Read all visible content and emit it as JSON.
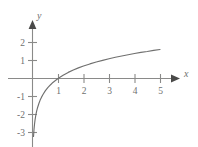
{
  "chart_data": {
    "type": "line",
    "title": "",
    "xlabel": "x",
    "ylabel": "y",
    "function": "y = ln(x)",
    "xlim": [
      0,
      5.6
    ],
    "ylim": [
      -3.6,
      2.4
    ],
    "grid": false,
    "legend": null,
    "x_ticks": [
      1,
      2,
      3,
      4,
      5
    ],
    "x_tick_labels": [
      "1",
      "2",
      "3",
      "4",
      "5"
    ],
    "y_ticks": [
      -3,
      -2,
      -1,
      1,
      2
    ],
    "y_tick_labels": [
      "-3",
      "-2",
      "-1",
      "1",
      "2"
    ],
    "x": [
      0.04,
      0.06,
      0.08,
      0.1,
      0.13,
      0.16,
      0.2,
      0.25,
      0.3,
      0.35,
      0.4,
      0.5,
      0.6,
      0.7,
      0.8,
      0.9,
      1.0,
      1.2,
      1.4,
      1.6,
      1.8,
      2.0,
      2.25,
      2.5,
      2.75,
      3.0,
      3.25,
      3.5,
      3.75,
      4.0,
      4.25,
      4.5,
      4.75,
      5.0
    ],
    "y": [
      -3.22,
      -2.81,
      -2.53,
      -2.3,
      -2.04,
      -1.83,
      -1.61,
      -1.39,
      -1.2,
      -1.05,
      -0.92,
      -0.69,
      -0.51,
      -0.36,
      -0.22,
      -0.11,
      0.0,
      0.18,
      0.34,
      0.47,
      0.59,
      0.69,
      0.81,
      0.92,
      1.01,
      1.1,
      1.18,
      1.25,
      1.32,
      1.39,
      1.45,
      1.5,
      1.56,
      1.61
    ],
    "curve_color": "#70706f",
    "axis_color": "#8a8a89",
    "background_color": "#ffffff",
    "x_axis_label_text": "x",
    "y_axis_label_text": "y",
    "x_arrow": true,
    "y_arrow": true
  }
}
